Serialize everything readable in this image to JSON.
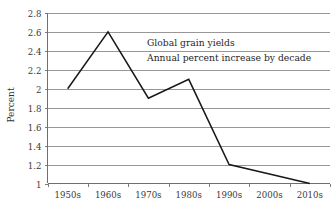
{
  "chart_data": {
    "type": "line",
    "title": "",
    "annotations": [
      "Global grain yields",
      "Annual percent increase by decade"
    ],
    "xlabel": "",
    "ylabel": "Percent",
    "categories": [
      "1950s",
      "1960s",
      "1970s",
      "1980s",
      "1990s",
      "2000s",
      "2010s"
    ],
    "values": [
      2.0,
      2.6,
      1.9,
      2.1,
      1.2,
      1.1,
      1.0
    ],
    "series": [
      {
        "name": "Global grain yields",
        "values": [
          2.0,
          2.6,
          1.9,
          2.1,
          1.2,
          1.1,
          1.0
        ]
      }
    ],
    "ylim": [
      1,
      2.8
    ],
    "ytick_labels": [
      "2.8",
      "2.6",
      "2.4",
      "2.2",
      "2",
      "1.8",
      "1.6",
      "1.4",
      "1.2",
      "1"
    ],
    "ytick_values": [
      2.8,
      2.6,
      2.4,
      2.2,
      2.0,
      1.8,
      1.6,
      1.4,
      1.2,
      1.0
    ],
    "grid": "horizontal",
    "legend": "none",
    "line_color": "#171717",
    "grid_color": "#8c8c8c",
    "background_color": "#ffffff"
  }
}
